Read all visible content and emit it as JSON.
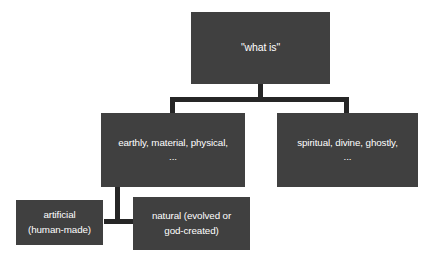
{
  "diagram": {
    "type": "hierarchy-tree",
    "background_color": "#ffffff",
    "node_fill_color": "#404040",
    "node_text_color": "#ffffff",
    "connector_color": "#262626",
    "nodes": {
      "root": {
        "id": "what-is",
        "label": "\"what is\"",
        "level": 0
      },
      "earthly": {
        "id": "earthly-material-physical",
        "label": "earthly, material, physical,\n...",
        "level": 1
      },
      "spiritual": {
        "id": "spiritual-divine-ghostly",
        "label": "spiritual, divine, ghostly,\n...",
        "level": 1
      },
      "artificial": {
        "id": "artificial-human-made",
        "label": "artificial\n(human-made)",
        "level": 2
      },
      "natural": {
        "id": "natural-evolved-or-god-created",
        "label": "natural (evolved or\ngod-created)",
        "level": 2
      }
    },
    "edges": [
      {
        "from": "what-is",
        "to": "earthly-material-physical",
        "style": "bracket"
      },
      {
        "from": "what-is",
        "to": "spiritual-divine-ghostly",
        "style": "bracket"
      },
      {
        "from": "earthly-material-physical",
        "to": "artificial-human-made",
        "style": "inverted-t"
      },
      {
        "from": "earthly-material-physical",
        "to": "natural-evolved-or-god-created",
        "style": "inverted-t"
      }
    ]
  }
}
